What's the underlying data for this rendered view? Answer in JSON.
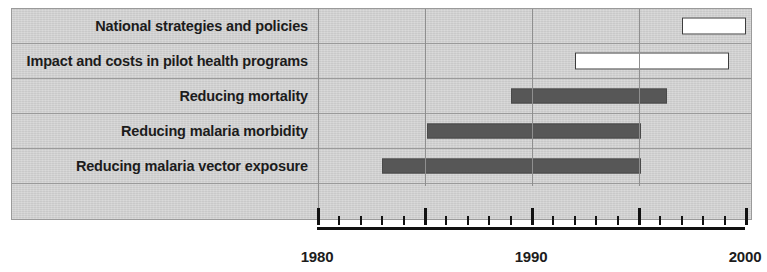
{
  "chart_data": {
    "type": "bar",
    "chart_style": "gantt-timeline",
    "title": "",
    "xlabel": "",
    "ylabel": "",
    "xlim": [
      1980,
      2000
    ],
    "grid": true,
    "gridlines_x": [
      1980,
      1985,
      1990,
      1995
    ],
    "legend": "none",
    "axis": {
      "major_ticks": [
        1980,
        1985,
        1990,
        1995,
        2000
      ],
      "major_tick_labels": [
        "1980",
        "",
        "1990",
        "",
        "2000"
      ],
      "minor_tick_step": 1,
      "visible_tick_labels": [
        "1980",
        "1990",
        "2000"
      ]
    },
    "categories": [
      "National strategies and policies",
      "Impact and costs in pilot health programs",
      "Reducing mortality",
      "Reducing malaria morbidity",
      "Reducing malaria vector exposure"
    ],
    "bars": [
      {
        "category": "National strategies and policies",
        "start": 1997,
        "end": 2000,
        "style": "hollow",
        "fill": "#ffffff",
        "edge": "#3d3d3d"
      },
      {
        "category": "Impact and costs in pilot health programs",
        "start": 1992,
        "end": 1999.2,
        "style": "hollow",
        "fill": "#ffffff",
        "edge": "#3d3d3d"
      },
      {
        "category": "Reducing mortality",
        "start": 1989,
        "end": 1996.3,
        "style": "filled",
        "fill": "#575757",
        "edge": "#4a4a4a"
      },
      {
        "category": "Reducing malaria morbidity",
        "start": 1985.1,
        "end": 1995.1,
        "style": "filled",
        "fill": "#575757",
        "edge": "#4a4a4a"
      },
      {
        "category": "Reducing malaria vector exposure",
        "start": 1983,
        "end": 1995.1,
        "style": "filled",
        "fill": "#575757",
        "edge": "#4a4a4a"
      }
    ]
  },
  "rows": [
    {
      "label": "National strategies and policies"
    },
    {
      "label": "Impact and costs in pilot health programs"
    },
    {
      "label": "Reducing mortality"
    },
    {
      "label": "Reducing malaria morbidity"
    },
    {
      "label": "Reducing malaria vector exposure"
    }
  ],
  "axis_labels": [
    {
      "text": "1980",
      "year": 1980
    },
    {
      "text": "1990",
      "year": 1990
    },
    {
      "text": "2000",
      "year": 2000
    }
  ],
  "colors": {
    "panel_background": "#cfcfcf",
    "gridline": "#9a9a9a",
    "bar_filled": "#575757",
    "bar_hollow_fill": "#ffffff",
    "bar_hollow_edge": "#3d3d3d",
    "axis": "#121212",
    "text": "#1c1c1c"
  }
}
